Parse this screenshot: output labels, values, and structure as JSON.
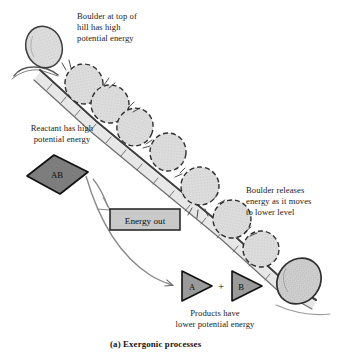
{
  "figure": {
    "caption": "(a) Exergonic processes",
    "background_color": "#ffffff",
    "ink_color": "#1a1a1a"
  },
  "annotations": {
    "top": "Boulder at top of\nhill has high\npotential energy",
    "reactant": "Reactant has high\npotential energy",
    "release": "Boulder releases\nenergy as it moves\nto lower level",
    "products": "Products have\nlower potential energy"
  },
  "nodes": {
    "reactant": {
      "label": "AB",
      "shape": "diamond",
      "fill": "#7d7d7d",
      "stroke": "#111111"
    },
    "product_a": {
      "label": "A",
      "shape": "triangle-right",
      "fill": "#9a9a9a",
      "stroke": "#111111"
    },
    "product_b": {
      "label": "B",
      "shape": "triangle-right",
      "fill": "#9a9a9a",
      "stroke": "#111111"
    },
    "plus": {
      "label": "+"
    },
    "energy_out": {
      "label": "Energy out",
      "shape": "rect",
      "fill": "#c9c9c9",
      "stroke": "#2b2b2b"
    }
  },
  "scene": {
    "hill": {
      "description": "downhill slope from upper-left to lower-right",
      "stroke": "#4a4a4a"
    },
    "boulders": [
      {
        "state": "at-rest-top",
        "cx": 44,
        "cy": 47,
        "rx": 18,
        "ry": 21,
        "rot": -18,
        "outline": "solid",
        "fill": "#dcdcdc"
      },
      {
        "state": "rolling",
        "cx": 84,
        "cy": 84,
        "rx": 19,
        "ry": 20,
        "rot": -10,
        "outline": "dashed",
        "fill": "#d8d8d8"
      },
      {
        "state": "rolling",
        "cx": 110,
        "cy": 104,
        "rx": 19,
        "ry": 19,
        "rot": 8,
        "outline": "dashed",
        "fill": "#dadada"
      },
      {
        "state": "rolling",
        "cx": 135,
        "cy": 127,
        "rx": 18,
        "ry": 19,
        "rot": 20,
        "outline": "dashed",
        "fill": "#d8d8d8"
      },
      {
        "state": "rolling",
        "cx": 168,
        "cy": 152,
        "rx": 18,
        "ry": 19,
        "rot": 5,
        "outline": "dashed",
        "fill": "#dadada"
      },
      {
        "state": "rolling",
        "cx": 200,
        "cy": 186,
        "rx": 19,
        "ry": 19,
        "rot": -6,
        "outline": "dashed",
        "fill": "#d8d8d8"
      },
      {
        "state": "rolling",
        "cx": 232,
        "cy": 219,
        "rx": 19,
        "ry": 19,
        "rot": 12,
        "outline": "dashed",
        "fill": "#dadada"
      },
      {
        "state": "rolling",
        "cx": 261,
        "cy": 249,
        "rx": 18,
        "ry": 18,
        "rot": 4,
        "outline": "dashed",
        "fill": "#d8d8d8"
      },
      {
        "state": "at-rest-bottom",
        "cx": 299,
        "cy": 281,
        "rx": 21,
        "ry": 24,
        "rot": 38,
        "outline": "solid",
        "fill": "#cfcfcf"
      }
    ]
  },
  "flow": {
    "energy_arrow_label": "energy-out-branch",
    "reaction_arrow_label": "reactant-to-products"
  }
}
